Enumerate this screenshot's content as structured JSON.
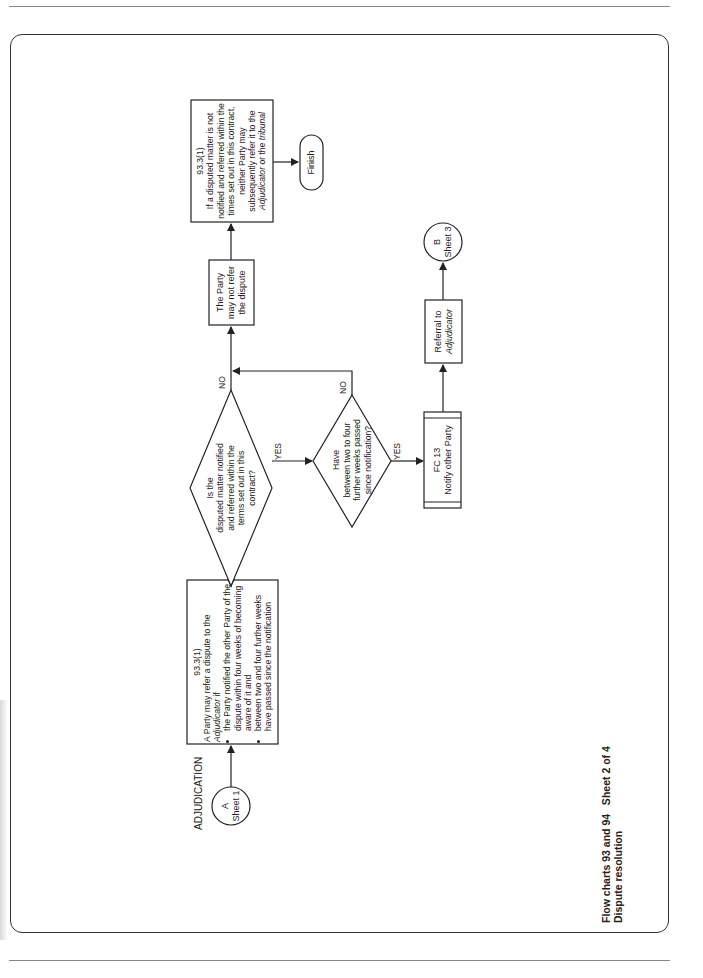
{
  "page": {
    "title_line1": "Flow charts 93 and 94   Sheet 2 of 4",
    "title_line2": "Dispute resolution"
  },
  "section_label": "ADJUDICATION",
  "connectors": {
    "start": {
      "letter": "A",
      "sheet": "Sheet 1"
    },
    "end": {
      "letter": "B",
      "sheet": "Sheet 3"
    }
  },
  "nodes": {
    "clause_refer": {
      "ref": "93.3(1)",
      "intro": "A Party may refer a dispute to the",
      "intro_italic": "Adjudicator",
      "intro_suffix": " if",
      "bullets": [
        "the Party notified the other Party of the dispute within four weeks of becoming aware of it and",
        "between two and four further weeks have passed since the notification"
      ]
    },
    "decision_terms": {
      "line1": "Is the",
      "line2": "disputed matter notified",
      "line3": "and referred within the",
      "line4": "terms set out in this",
      "line5": "contract?",
      "yes": "YES",
      "no": "NO"
    },
    "decision_weeks": {
      "line1": "Have",
      "line2": "between two to four",
      "line3": "further weeks passed",
      "line4": "since notification?",
      "yes": "YES",
      "no": "NO"
    },
    "may_not_refer": {
      "line1": "The Party",
      "line2": "may not refer",
      "line3": "the dispute"
    },
    "clause_not_notified": {
      "ref": "93.3(1)",
      "text_a": "If a disputed matter is not notified and referred within the times set out in this contract, neither Party may subsequently refer it to the",
      "italic_a": "Adjudicator",
      "text_b": " or the ",
      "italic_b": "tribunal"
    },
    "finish": {
      "label": "Finish"
    },
    "notify": {
      "ref": "FC 13",
      "label": "Notify other Party"
    },
    "referral": {
      "line1": "Referral to",
      "line2_italic": "Adjudicator"
    }
  },
  "colors": {
    "line": "#222222",
    "frame": "#333333",
    "rule": "#888888",
    "background": "#ffffff"
  }
}
